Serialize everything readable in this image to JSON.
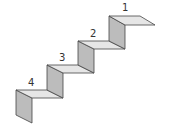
{
  "diagram": {
    "title": "",
    "type": "staircase",
    "colors": {
      "top_face": "#e6e6e6",
      "riser_face": "#bcbcbc",
      "stroke": "#444444",
      "label": "#333333"
    },
    "steps": [
      {
        "label": "1"
      },
      {
        "label": "2"
      },
      {
        "label": "3"
      },
      {
        "label": "4"
      }
    ]
  }
}
